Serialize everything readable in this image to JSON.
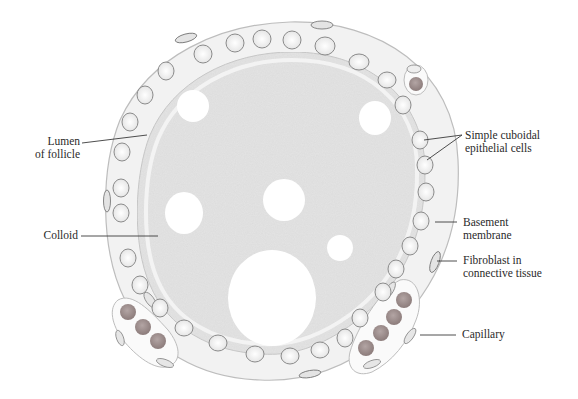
{
  "figure": {
    "colors": {
      "background": "#ffffff",
      "colloid": "#e4e4e4",
      "epithelium": "#f1f1f1",
      "nucleus_fill": "#f4f4f4",
      "nucleus_stroke": "#8a8a8a",
      "rbc": "#9a8b8a",
      "leader_line": "#3a3a3a",
      "label_text": "#2a2a2a"
    },
    "labels": [
      {
        "id": "lumen",
        "text_line1": "Lumen",
        "text_line2": "of follicle"
      },
      {
        "id": "colloid",
        "text_line1": "Colloid"
      },
      {
        "id": "cuboidal",
        "text_line1": "Simple cuboidal",
        "text_line2": "epithelial cells"
      },
      {
        "id": "basement",
        "text_line1": "Basement",
        "text_line2": "membrane"
      },
      {
        "id": "fibroblast",
        "text_line1": "Fibroblast in",
        "text_line2": "connective tissue"
      },
      {
        "id": "capillary",
        "text_line1": "Capillary"
      }
    ]
  }
}
